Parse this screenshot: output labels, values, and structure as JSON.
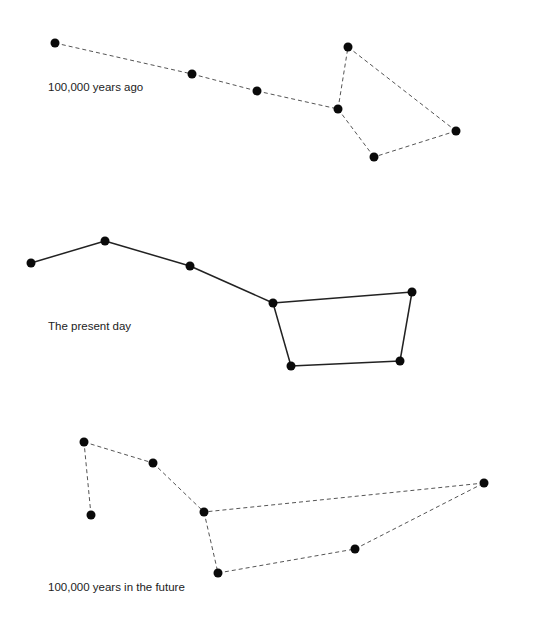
{
  "diagram": {
    "colors": {
      "star": "#0a0a0a",
      "line_solid": "#222222",
      "line_dashed": "#555555",
      "label": "#222222"
    },
    "panels": [
      {
        "label": "100,000 years ago",
        "label_pos": [
          48,
          88
        ],
        "line_style": "dashed",
        "stars": [
          [
            55,
            43
          ],
          [
            192,
            74
          ],
          [
            257,
            91
          ],
          [
            338,
            109
          ],
          [
            348,
            47
          ],
          [
            456,
            131
          ],
          [
            374,
            157
          ]
        ],
        "edges": [
          [
            0,
            1
          ],
          [
            1,
            2
          ],
          [
            2,
            3
          ],
          [
            3,
            4
          ],
          [
            4,
            5
          ],
          [
            5,
            6
          ],
          [
            6,
            3
          ]
        ]
      },
      {
        "label": "The present day",
        "label_pos": [
          48,
          327
        ],
        "line_style": "solid",
        "stars": [
          [
            31,
            263
          ],
          [
            105,
            241
          ],
          [
            190,
            266
          ],
          [
            273,
            303
          ],
          [
            412,
            292
          ],
          [
            400,
            361
          ],
          [
            291,
            366
          ]
        ],
        "edges": [
          [
            0,
            1
          ],
          [
            1,
            2
          ],
          [
            2,
            3
          ],
          [
            3,
            4
          ],
          [
            4,
            5
          ],
          [
            5,
            6
          ],
          [
            6,
            3
          ]
        ]
      },
      {
        "label": "100,000 years in the future",
        "label_pos": [
          48,
          588
        ],
        "line_style": "dashed",
        "stars": [
          [
            91,
            515
          ],
          [
            84,
            442
          ],
          [
            153,
            463
          ],
          [
            204,
            512
          ],
          [
            218,
            573
          ],
          [
            355,
            549
          ],
          [
            484,
            483
          ]
        ],
        "edges": [
          [
            0,
            1
          ],
          [
            1,
            2
          ],
          [
            2,
            3
          ],
          [
            3,
            4
          ],
          [
            4,
            5
          ],
          [
            5,
            6
          ],
          [
            6,
            3
          ]
        ]
      }
    ]
  }
}
